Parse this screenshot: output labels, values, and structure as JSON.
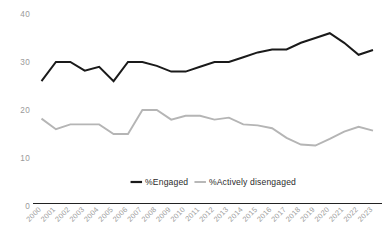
{
  "chart_data": {
    "type": "line",
    "title": "",
    "subtitle": "",
    "xlabel": "",
    "ylabel": "",
    "categories": [
      "2000",
      "2001",
      "2002",
      "2003",
      "2004",
      "2005",
      "2006",
      "2007",
      "2008",
      "2009",
      "2010",
      "2011",
      "2012",
      "2013",
      "2014",
      "2015",
      "2016",
      "2017",
      "2018",
      "2019",
      "2020",
      "2021",
      "2022",
      "2023"
    ],
    "series": [
      {
        "name": "%Engaged",
        "color": "#1a1a1a",
        "values": [
          26.0,
          30.0,
          30.0,
          28.2,
          29.0,
          26.0,
          30.0,
          30.0,
          29.2,
          28.0,
          28.0,
          29.0,
          30.0,
          30.0,
          31.0,
          32.0,
          32.6,
          32.6,
          34.0,
          35.0,
          36.0,
          34.0,
          31.5,
          32.5
        ]
      },
      {
        "name": "%Actively disengaged",
        "color": "#b5b5b5",
        "values": [
          18.2,
          16.0,
          17.0,
          17.0,
          17.0,
          15.0,
          15.0,
          20.0,
          20.0,
          18.0,
          18.8,
          18.8,
          18.0,
          18.4,
          17.0,
          16.8,
          16.2,
          14.2,
          12.8,
          12.6,
          14.0,
          15.5,
          16.5,
          15.7
        ]
      }
    ],
    "yticks": [
      0,
      10,
      20,
      30,
      40
    ],
    "ylim": [
      0,
      42
    ],
    "grid": false,
    "legend_position": "bottom-center",
    "legend": [
      {
        "label": "%Engaged",
        "color": "#1a1a1a"
      },
      {
        "label": "%Actively disengaged",
        "color": "#b5b5b5"
      }
    ],
    "axis_color": "#222222",
    "tick_label_color": "#9a9a9a"
  }
}
